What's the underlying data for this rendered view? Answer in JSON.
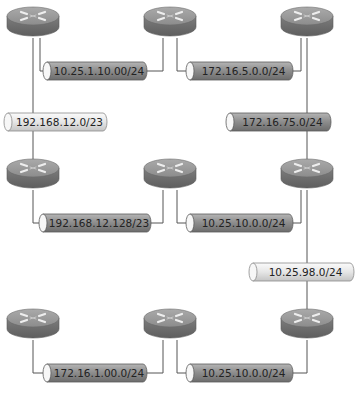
{
  "colors": {
    "background": "#ffffff",
    "line": "#555555",
    "router_top": "#9a9a9a",
    "router_side": "#707070",
    "router_arrow": "#e6e6e6",
    "segment_dark": "#8e8e8e",
    "segment_light": "#e4e4e4"
  },
  "routers": [
    {
      "id": "r1",
      "cx": 33,
      "cy": 20
    },
    {
      "id": "r2",
      "cx": 170,
      "cy": 20
    },
    {
      "id": "r3",
      "cx": 307,
      "cy": 20
    },
    {
      "id": "r4",
      "cx": 33,
      "cy": 172
    },
    {
      "id": "r5",
      "cx": 170,
      "cy": 172
    },
    {
      "id": "r6",
      "cx": 307,
      "cy": 172
    },
    {
      "id": "r7",
      "cx": 33,
      "cy": 322
    },
    {
      "id": "r8",
      "cx": 170,
      "cy": 322
    },
    {
      "id": "r9",
      "cx": 307,
      "cy": 322
    }
  ],
  "segments": [
    {
      "label": "10.25.1.10.00/24",
      "style": "dark",
      "x": 47,
      "y": 62,
      "w": 100
    },
    {
      "label": "172.16.5.0.0/24",
      "style": "dark",
      "x": 190,
      "y": 62,
      "w": 103
    },
    {
      "label": "192.168.12.0/23",
      "style": "light",
      "x": 8,
      "y": 113,
      "w": 99
    },
    {
      "label": "172.16.75.0/24",
      "style": "dark",
      "x": 230,
      "y": 113,
      "w": 101
    },
    {
      "label": "192.168.12.128/23",
      "style": "dark",
      "x": 43,
      "y": 214,
      "w": 108
    },
    {
      "label": "10.25.10.0.0/24",
      "style": "dark",
      "x": 190,
      "y": 214,
      "w": 103
    },
    {
      "label": "10.25.98.0/24",
      "style": "light",
      "x": 253,
      "y": 263,
      "w": 101
    },
    {
      "label": "172.16.1.00.0/24",
      "style": "dark",
      "x": 47,
      "y": 364,
      "w": 100
    },
    {
      "label": "10.25.10.0.0/24",
      "style": "dark",
      "x": 190,
      "y": 364,
      "w": 103
    }
  ]
}
